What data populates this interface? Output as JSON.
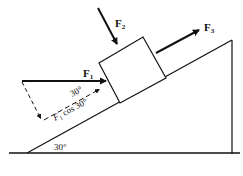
{
  "diagram": {
    "incline_angle_label": "30°",
    "forces": {
      "f1": {
        "label": "F",
        "sub": "1"
      },
      "f2": {
        "label": "F",
        "sub": "2"
      },
      "f3": {
        "label": "F",
        "sub": "3"
      }
    },
    "component": {
      "angle_label": "30°",
      "label_main": "F",
      "label_sub": "1",
      "label_rest": " cos 30°"
    },
    "colors": {
      "ink": "#111111",
      "background": "#ffffff"
    }
  }
}
